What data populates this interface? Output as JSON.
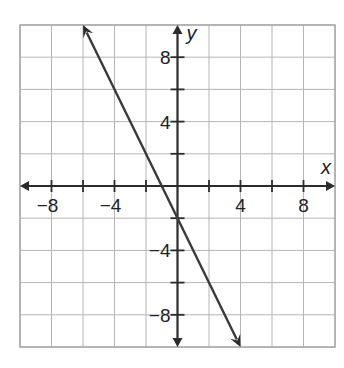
{
  "chart_data": {
    "type": "line",
    "title": "",
    "xlabel": "x",
    "ylabel": "y",
    "xlim": [
      -10,
      10
    ],
    "ylim": [
      -10,
      10
    ],
    "grid": true,
    "grid_step": 2,
    "x_ticks": [
      -8,
      -6,
      -4,
      -2,
      2,
      4,
      6,
      8
    ],
    "y_ticks": [
      -8,
      -6,
      -4,
      -2,
      2,
      4,
      6,
      8
    ],
    "x_tick_labels": [
      {
        "value": -8,
        "label": "−8"
      },
      {
        "value": -4,
        "label": "−4"
      },
      {
        "value": 4,
        "label": "4"
      },
      {
        "value": 8,
        "label": "8"
      }
    ],
    "y_tick_labels": [
      {
        "value": 8,
        "label": "8"
      },
      {
        "value": 4,
        "label": "4"
      },
      {
        "value": -4,
        "label": "−4"
      },
      {
        "value": -8,
        "label": "−8"
      }
    ],
    "series": [
      {
        "name": "y = -2x - 2",
        "equation": "y = -2x - 2",
        "slope": -2,
        "intercept": -2,
        "x": [
          -6,
          4
        ],
        "y": [
          10,
          -10
        ],
        "arrows_both_ends": true,
        "color": "#3a3a3a"
      }
    ],
    "legend": "none"
  }
}
